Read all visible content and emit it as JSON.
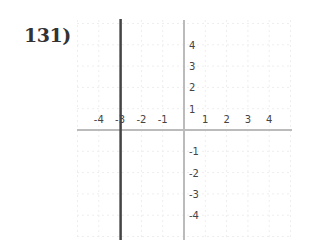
{
  "problem": {
    "number_label": "131)"
  },
  "chart_data": {
    "type": "line",
    "title": "",
    "xlabel": "",
    "ylabel": "",
    "xlim": [
      -5,
      5
    ],
    "ylim": [
      -5,
      5
    ],
    "grid": true,
    "x_tick_labels": [
      "-4",
      "-3",
      "-2",
      "-1",
      "1",
      "2",
      "3",
      "4"
    ],
    "y_tick_labels": [
      "4",
      "3",
      "2",
      "1",
      "-1",
      "-2",
      "-3",
      "-4"
    ],
    "series": [
      {
        "name": "vertical line",
        "equation": "x = -3",
        "x": [
          -3,
          -3
        ],
        "y": [
          -5,
          5
        ],
        "color": "#444444"
      }
    ],
    "colors": {
      "axis": "#bbbbbb",
      "grid": "#eeeeee",
      "line": "#444444"
    }
  }
}
